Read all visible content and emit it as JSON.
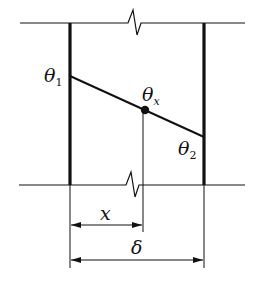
{
  "diagram": {
    "labels": {
      "theta1": {
        "base": "θ",
        "sub": "1"
      },
      "theta2": {
        "base": "θ",
        "sub": "2"
      },
      "thetax": {
        "base": "θ",
        "sub": "x"
      },
      "x": "x",
      "delta": "δ"
    },
    "colors": {
      "line": "#111111",
      "background": "#ffffff"
    },
    "geometry": {
      "top_boundary_y": 23,
      "bottom_boundary_y": 185,
      "left_wall_x": 70,
      "right_wall_x": 204,
      "theta1_point": [
        70,
        76
      ],
      "theta2_point": [
        204,
        137
      ],
      "thetax_point": [
        145,
        110
      ],
      "x_dimension_y": 225,
      "delta_dimension_y": 260
    }
  }
}
